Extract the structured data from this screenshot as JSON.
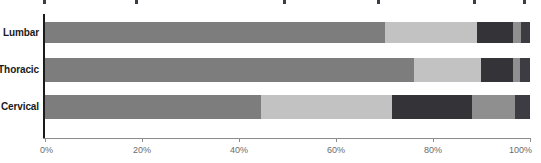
{
  "chart_data": {
    "type": "bar",
    "orientation": "horizontal",
    "stacked": true,
    "stack_normalized": true,
    "title": "",
    "subtitle": "",
    "xlabel": "",
    "ylabel": "",
    "xlim": [
      0,
      100
    ],
    "grid": false,
    "legend_position": "top-cropped",
    "categories": [
      "Lumbar",
      "Thoracic",
      "Cervical"
    ],
    "xtick_labels": [
      "0%",
      "20%",
      "40%",
      "60%",
      "80%",
      "100%"
    ],
    "xtick_values": [
      0,
      20,
      40,
      60,
      80,
      100
    ],
    "series": [
      {
        "name": "Series 1",
        "color": "#7d7d7d",
        "values": [
          70.0,
          76.0,
          44.5
        ]
      },
      {
        "name": "Series 2",
        "color": "#c2c2c2",
        "values": [
          19.0,
          14.0,
          27.0
        ]
      },
      {
        "name": "Series 3",
        "color": "#333338",
        "values": [
          7.5,
          6.6,
          16.5
        ]
      },
      {
        "name": "Series 4",
        "color": "#8f8f8f",
        "values": [
          1.7,
          1.4,
          9.0
        ]
      },
      {
        "name": "Series 5",
        "color": "#3c3c42",
        "values": [
          1.8,
          2.0,
          3.0
        ]
      }
    ],
    "rows": [
      {
        "category": "Lumbar",
        "segments": [
          70.0,
          19.0,
          7.5,
          1.7,
          1.8
        ]
      },
      {
        "category": "Thoracic",
        "segments": [
          76.0,
          14.0,
          6.6,
          1.4,
          2.0
        ]
      },
      {
        "category": "Cervical",
        "segments": [
          44.5,
          27.0,
          16.5,
          9.0,
          3.0
        ]
      }
    ]
  },
  "axis": {
    "spine_color": "#1a1a1a",
    "tick_color": "#8c8c8c",
    "tick_label_color": "#6b6b6b"
  },
  "legend_remnant": {
    "tick_positions": [
      43,
      135,
      283,
      377,
      473,
      523
    ]
  }
}
